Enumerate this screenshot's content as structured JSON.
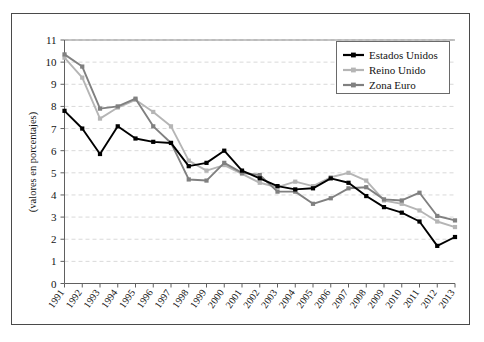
{
  "chart_data": {
    "type": "line",
    "title": "",
    "xlabel": "",
    "ylabel": "(valores en porcentajes)",
    "ylim": [
      0,
      11
    ],
    "ytick_step": 1,
    "grid": true,
    "grid_style": "dashed-horizontal",
    "legend_position": "top-right",
    "categories": [
      "1991",
      "1992",
      "1993",
      "1994",
      "1995",
      "1996",
      "1997",
      "1998",
      "1999",
      "2000",
      "2001",
      "2002",
      "2003",
      "2004",
      "2005",
      "2006",
      "2007",
      "2008",
      "2009",
      "2010",
      "2011",
      "2012",
      "2013"
    ],
    "yticks": [
      "0",
      "1",
      "2",
      "3",
      "4",
      "5",
      "6",
      "7",
      "8",
      "9",
      "10",
      "11"
    ],
    "series": [
      {
        "name": "Estados Unidos",
        "color": "#000000",
        "marker": "square",
        "values": [
          7.8,
          7.0,
          5.85,
          7.1,
          6.55,
          6.4,
          6.35,
          5.3,
          5.45,
          6.0,
          5.1,
          4.75,
          4.4,
          4.25,
          4.3,
          4.75,
          4.55,
          3.95,
          3.45,
          3.2,
          2.8,
          1.7,
          2.1
        ]
      },
      {
        "name": "Reino Unido",
        "color": "#b5b5b5",
        "marker": "square",
        "values": [
          10.2,
          9.3,
          7.45,
          7.95,
          8.3,
          7.75,
          7.1,
          5.55,
          5.1,
          5.35,
          4.95,
          4.55,
          4.35,
          4.6,
          4.4,
          4.8,
          5.0,
          4.65,
          3.75,
          3.6,
          3.3,
          2.8,
          2.55
        ]
      },
      {
        "name": "Zona Euro",
        "color": "#808080",
        "marker": "square",
        "values": [
          10.35,
          9.8,
          7.9,
          8.0,
          8.35,
          7.1,
          6.35,
          4.7,
          4.65,
          5.45,
          5.0,
          4.9,
          4.15,
          4.15,
          3.6,
          3.85,
          4.3,
          4.35,
          3.8,
          3.75,
          4.1,
          3.05,
          2.85
        ]
      }
    ]
  },
  "legend": {
    "entries": [
      {
        "label": "Estados Unidos"
      },
      {
        "label": "Reino Unido"
      },
      {
        "label": "Zona Euro"
      }
    ]
  },
  "axes": {
    "y_axis_title": "(valores en porcentajes)"
  }
}
